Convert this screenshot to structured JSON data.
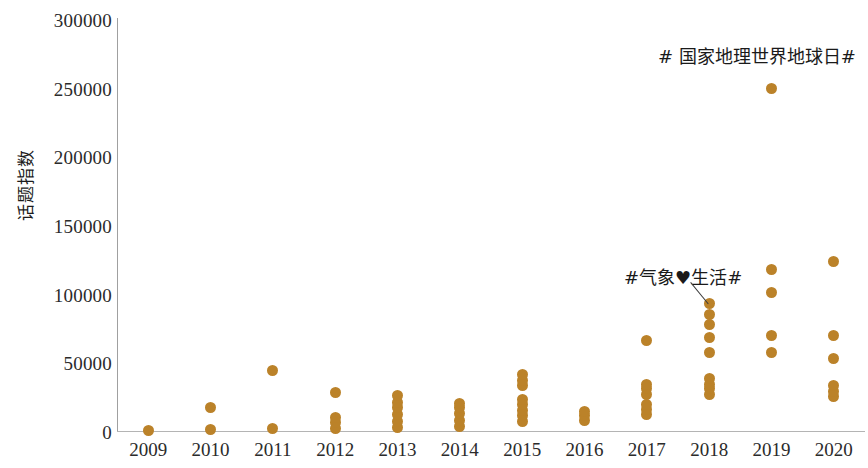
{
  "chart_data": {
    "type": "scatter",
    "title": "",
    "xlabel": "",
    "ylabel": "话题指数",
    "xlim": [
      2008.5,
      2020.5
    ],
    "ylim": [
      0,
      300000
    ],
    "grid": false,
    "legend": null,
    "y_ticks": [
      0,
      50000,
      100000,
      150000,
      200000,
      250000,
      300000
    ],
    "y_tick_labels": [
      "0",
      "50000",
      "100000",
      "150000",
      "200000",
      "250000",
      "300000"
    ],
    "x_ticks": [
      2009,
      2010,
      2011,
      2012,
      2013,
      2014,
      2015,
      2016,
      2017,
      2018,
      2019,
      2020
    ],
    "x_tick_labels": [
      "2009",
      "2010",
      "2011",
      "2012",
      "2013",
      "2014",
      "2015",
      "2016",
      "2017",
      "2018",
      "2019",
      "2020"
    ],
    "marker_color": "#bb8229",
    "series": [
      {
        "name": "话题指数",
        "points": [
          {
            "x": 2009,
            "y": 500
          },
          {
            "x": 2010,
            "y": 1000
          },
          {
            "x": 2010,
            "y": 17000
          },
          {
            "x": 2011,
            "y": 1500
          },
          {
            "x": 2011,
            "y": 44000
          },
          {
            "x": 2012,
            "y": 2000
          },
          {
            "x": 2012,
            "y": 6000
          },
          {
            "x": 2012,
            "y": 10000
          },
          {
            "x": 2012,
            "y": 28000
          },
          {
            "x": 2013,
            "y": 2500
          },
          {
            "x": 2013,
            "y": 7000
          },
          {
            "x": 2013,
            "y": 12000
          },
          {
            "x": 2013,
            "y": 17000
          },
          {
            "x": 2013,
            "y": 21000
          },
          {
            "x": 2013,
            "y": 26000
          },
          {
            "x": 2014,
            "y": 3000
          },
          {
            "x": 2014,
            "y": 8000
          },
          {
            "x": 2014,
            "y": 13000
          },
          {
            "x": 2014,
            "y": 17000
          },
          {
            "x": 2014,
            "y": 20000
          },
          {
            "x": 2015,
            "y": 7000
          },
          {
            "x": 2015,
            "y": 11000
          },
          {
            "x": 2015,
            "y": 15000
          },
          {
            "x": 2015,
            "y": 19000
          },
          {
            "x": 2015,
            "y": 23000
          },
          {
            "x": 2015,
            "y": 33000
          },
          {
            "x": 2015,
            "y": 37000
          },
          {
            "x": 2015,
            "y": 41000
          },
          {
            "x": 2016,
            "y": 8000
          },
          {
            "x": 2016,
            "y": 11000
          },
          {
            "x": 2016,
            "y": 14000
          },
          {
            "x": 2017,
            "y": 12000
          },
          {
            "x": 2017,
            "y": 16000
          },
          {
            "x": 2017,
            "y": 19000
          },
          {
            "x": 2017,
            "y": 27000
          },
          {
            "x": 2017,
            "y": 31000
          },
          {
            "x": 2017,
            "y": 34000
          },
          {
            "x": 2017,
            "y": 66000
          },
          {
            "x": 2018,
            "y": 27000
          },
          {
            "x": 2018,
            "y": 31000
          },
          {
            "x": 2018,
            "y": 34000
          },
          {
            "x": 2018,
            "y": 38000
          },
          {
            "x": 2018,
            "y": 57000
          },
          {
            "x": 2018,
            "y": 68000
          },
          {
            "x": 2018,
            "y": 78000
          },
          {
            "x": 2018,
            "y": 85000
          },
          {
            "x": 2018,
            "y": 93000
          },
          {
            "x": 2019,
            "y": 57000
          },
          {
            "x": 2019,
            "y": 70000
          },
          {
            "x": 2019,
            "y": 101000
          },
          {
            "x": 2019,
            "y": 118000
          },
          {
            "x": 2019,
            "y": 250000
          },
          {
            "x": 2020,
            "y": 25000
          },
          {
            "x": 2020,
            "y": 29000
          },
          {
            "x": 2020,
            "y": 33000
          },
          {
            "x": 2020,
            "y": 53000
          },
          {
            "x": 2020,
            "y": 70000
          },
          {
            "x": 2020,
            "y": 124000
          }
        ]
      }
    ],
    "annotations": [
      {
        "id": "earthday",
        "text": "# 国家地理世界地球日#",
        "points_to_x": 2019,
        "points_to_y": 250000,
        "has_leader_line": false
      },
      {
        "id": "weather",
        "text": "#气象♥生活#",
        "points_to_x": 2018,
        "points_to_y": 93000,
        "has_leader_line": true
      }
    ]
  }
}
